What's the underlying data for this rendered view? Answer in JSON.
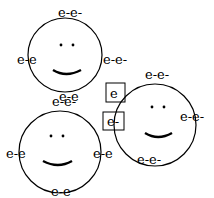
{
  "diagram": {
    "faces": [
      {
        "id": "face-top-left",
        "cx": 65,
        "cy": 55,
        "r": 37,
        "labels": [
          {
            "text": "e-e-",
            "x": 58,
            "y": 17
          },
          {
            "text": "e-e",
            "x": 17,
            "y": 64
          },
          {
            "text": "e-e-",
            "x": 103,
            "y": 64
          },
          {
            "text": "e-e",
            "x": 59,
            "y": 101
          }
        ]
      },
      {
        "id": "face-bottom-left",
        "cx": 60,
        "cy": 152,
        "r": 41,
        "labels": [
          {
            "text": "e-e-",
            "x": 52,
            "y": 106
          },
          {
            "text": "e-e",
            "x": 6,
            "y": 158
          },
          {
            "text": "e-e",
            "x": 93,
            "y": 158
          },
          {
            "text": "e-e",
            "x": 51,
            "y": 200
          }
        ]
      },
      {
        "id": "face-right",
        "cx": 155,
        "cy": 125,
        "r": 41,
        "labels": [
          {
            "text": "e-e-",
            "x": 145,
            "y": 79
          },
          {
            "text": "e-e-",
            "x": 180,
            "y": 121
          },
          {
            "text": "e-e-",
            "x": 137,
            "y": 164
          }
        ]
      }
    ],
    "boxes": [
      {
        "text": "e",
        "x": 106,
        "y": 83,
        "w": 19,
        "h": 19
      },
      {
        "text": "e-",
        "x": 103,
        "y": 112,
        "w": 21,
        "h": 18
      }
    ],
    "colors": {
      "stroke": "#000000",
      "background": "#ffffff"
    }
  }
}
